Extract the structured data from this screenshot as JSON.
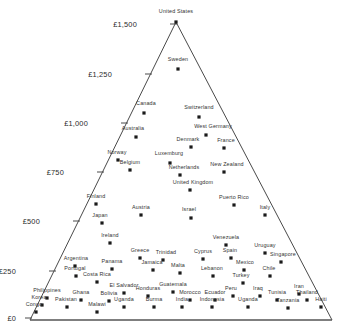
{
  "chart_data": {
    "type": "scatter",
    "title": "",
    "subtitle": "",
    "xlabel": "",
    "ylabel": "",
    "axis_tick_labels": [
      "£1,500",
      "£1,250",
      "£1,000",
      "£750",
      "£500",
      "£250",
      "£0"
    ],
    "axis_tick_values": [
      1500,
      1250,
      1000,
      750,
      500,
      250,
      0
    ],
    "ylim": [
      0,
      1500
    ],
    "grid": false,
    "legend": "none",
    "shape": "triangle",
    "currency_symbol": "£",
    "points": [
      {
        "label": "United States",
        "value": 1500,
        "x": 176,
        "y": 22,
        "lx": 176,
        "ly": 11
      },
      {
        "label": "Sweden",
        "value": 1190,
        "x": 178,
        "y": 69,
        "lx": 178,
        "ly": 59
      },
      {
        "label": "Canada",
        "value": 990,
        "x": 144,
        "y": 113,
        "lx": 146,
        "ly": 103
      },
      {
        "label": "Switzerland",
        "value": 980,
        "x": 199,
        "y": 117,
        "lx": 199,
        "ly": 107
      },
      {
        "label": "Australia",
        "value": 930,
        "x": 136,
        "y": 137,
        "lx": 133,
        "ly": 128
      },
      {
        "label": "West Germany",
        "value": 910,
        "x": 206,
        "y": 135,
        "lx": 213,
        "ly": 126
      },
      {
        "label": "Denmark",
        "value": 880,
        "x": 191,
        "y": 147,
        "lx": 188,
        "ly": 139
      },
      {
        "label": "France",
        "value": 860,
        "x": 224,
        "y": 148,
        "lx": 226,
        "ly": 140
      },
      {
        "label": "Norway",
        "value": 800,
        "x": 118,
        "y": 160,
        "lx": 117,
        "ly": 152
      },
      {
        "label": "Luxemburg",
        "value": 800,
        "x": 170,
        "y": 163,
        "lx": 169,
        "ly": 153
      },
      {
        "label": "Belgium",
        "value": 775,
        "x": 130,
        "y": 170,
        "lx": 130,
        "ly": 162
      },
      {
        "label": "Netherlands",
        "value": 760,
        "x": 180,
        "y": 175,
        "lx": 184,
        "ly": 167
      },
      {
        "label": "New Zealand",
        "value": 755,
        "x": 224,
        "y": 172,
        "lx": 227,
        "ly": 164
      },
      {
        "label": "United Kingdom",
        "value": 720,
        "x": 190,
        "y": 190,
        "lx": 193,
        "ly": 182
      },
      {
        "label": "Finland",
        "value": 620,
        "x": 96,
        "y": 204,
        "lx": 96,
        "ly": 196
      },
      {
        "label": "Puerto Rico",
        "value": 600,
        "x": 234,
        "y": 205,
        "lx": 234,
        "ly": 197
      },
      {
        "label": "Austria",
        "value": 580,
        "x": 141,
        "y": 215,
        "lx": 141,
        "ly": 207
      },
      {
        "label": "Israel",
        "value": 570,
        "x": 191,
        "y": 218,
        "lx": 189,
        "ly": 209
      },
      {
        "label": "Italy",
        "value": 560,
        "x": 265,
        "y": 215,
        "lx": 265,
        "ly": 207
      },
      {
        "label": "Japan",
        "value": 530,
        "x": 102,
        "y": 223,
        "lx": 100,
        "ly": 215
      },
      {
        "label": "Ireland",
        "value": 470,
        "x": 110,
        "y": 243,
        "lx": 110,
        "ly": 235
      },
      {
        "label": "Venezuela",
        "value": 450,
        "x": 226,
        "y": 245,
        "lx": 226,
        "ly": 237
      },
      {
        "label": "Uruguay",
        "value": 430,
        "x": 265,
        "y": 253,
        "lx": 265,
        "ly": 245
      },
      {
        "label": "Greece",
        "value": 400,
        "x": 140,
        "y": 258,
        "lx": 140,
        "ly": 250
      },
      {
        "label": "Spain",
        "value": 395,
        "x": 231,
        "y": 258,
        "lx": 230,
        "ly": 250
      },
      {
        "label": "Singapore",
        "value": 385,
        "x": 281,
        "y": 262,
        "lx": 283,
        "ly": 254
      },
      {
        "label": "Trinidad",
        "value": 390,
        "x": 163,
        "y": 260,
        "lx": 166,
        "ly": 252
      },
      {
        "label": "Cyprus",
        "value": 385,
        "x": 203,
        "y": 259,
        "lx": 203,
        "ly": 251
      },
      {
        "label": "Argentina",
        "value": 345,
        "x": 75,
        "y": 266,
        "lx": 76,
        "ly": 258
      },
      {
        "label": "Panama",
        "value": 330,
        "x": 112,
        "y": 269,
        "lx": 112,
        "ly": 261
      },
      {
        "label": "Mexico",
        "value": 325,
        "x": 244,
        "y": 270,
        "lx": 245,
        "ly": 262
      },
      {
        "label": "Jamaica",
        "value": 320,
        "x": 153,
        "y": 270,
        "lx": 152,
        "ly": 262
      },
      {
        "label": "Malta",
        "value": 310,
        "x": 180,
        "y": 273,
        "lx": 178,
        "ly": 265
      },
      {
        "label": "Portugal",
        "value": 300,
        "x": 76,
        "y": 276,
        "lx": 75,
        "ly": 268
      },
      {
        "label": "Lebanon",
        "value": 300,
        "x": 213,
        "y": 276,
        "lx": 212,
        "ly": 268
      },
      {
        "label": "Chile",
        "value": 300,
        "x": 270,
        "y": 276,
        "lx": 269,
        "ly": 268
      },
      {
        "label": "Costa Rica",
        "value": 285,
        "x": 97,
        "y": 282,
        "lx": 97,
        "ly": 274
      },
      {
        "label": "Turkey",
        "value": 280,
        "x": 243,
        "y": 283,
        "lx": 241,
        "ly": 275
      },
      {
        "label": "Guatemala",
        "value": 250,
        "x": 173,
        "y": 292,
        "lx": 173,
        "ly": 284
      },
      {
        "label": "El Salvador",
        "value": 245,
        "x": 124,
        "y": 293,
        "lx": 124,
        "ly": 285
      },
      {
        "label": "Honduras",
        "value": 240,
        "x": 148,
        "y": 296,
        "lx": 148,
        "ly": 288
      },
      {
        "label": "Peru",
        "value": 240,
        "x": 233,
        "y": 296,
        "lx": 231,
        "ly": 288
      },
      {
        "label": "Iraq",
        "value": 235,
        "x": 260,
        "y": 296,
        "lx": 258,
        "ly": 288
      },
      {
        "label": "Iran",
        "value": 235,
        "x": 299,
        "y": 294,
        "lx": 299,
        "ly": 286
      },
      {
        "label": "Philippines",
        "value": 225,
        "x": 47,
        "y": 298,
        "lx": 47,
        "ly": 290
      },
      {
        "label": "Ghana",
        "value": 220,
        "x": 81,
        "y": 300,
        "lx": 81,
        "ly": 292
      },
      {
        "label": "Bolivia",
        "value": 215,
        "x": 109,
        "y": 301,
        "lx": 109,
        "ly": 293
      },
      {
        "label": "Morocco",
        "value": 215,
        "x": 190,
        "y": 300,
        "lx": 190,
        "ly": 292
      },
      {
        "label": "Ecuador",
        "value": 215,
        "x": 215,
        "y": 300,
        "lx": 215,
        "ly": 292
      },
      {
        "label": "Tunisia",
        "value": 215,
        "x": 277,
        "y": 300,
        "lx": 277,
        "ly": 292
      },
      {
        "label": "Thailand",
        "value": 210,
        "x": 307,
        "y": 300,
        "lx": 307,
        "ly": 292
      },
      {
        "label": "Korea",
        "value": 200,
        "x": 42,
        "y": 305,
        "lx": 39,
        "ly": 297
      },
      {
        "label": "Pakistan",
        "value": 195,
        "x": 67,
        "y": 307,
        "lx": 66,
        "ly": 299
      },
      {
        "label": "Uganda",
        "value": 190,
        "x": 124,
        "y": 307,
        "lx": 124,
        "ly": 299
      },
      {
        "label": "Burma",
        "value": 190,
        "x": 154,
        "y": 307,
        "lx": 154,
        "ly": 299
      },
      {
        "label": "India",
        "value": 190,
        "x": 182,
        "y": 307,
        "lx": 182,
        "ly": 299
      },
      {
        "label": "Indonesia",
        "value": 188,
        "x": 212,
        "y": 307,
        "lx": 212,
        "ly": 299
      },
      {
        "label": "Uganda",
        "value": 188,
        "x": 248,
        "y": 307,
        "lx": 248,
        "ly": 299
      },
      {
        "label": "Tanzania",
        "value": 185,
        "x": 288,
        "y": 308,
        "lx": 288,
        "ly": 300
      },
      {
        "label": "Haiti",
        "value": 185,
        "x": 321,
        "y": 307,
        "lx": 321,
        "ly": 299
      },
      {
        "label": "Congo",
        "value": 170,
        "x": 36,
        "y": 312,
        "lx": 34,
        "ly": 304
      },
      {
        "label": "Malawi",
        "value": 170,
        "x": 97,
        "y": 312,
        "lx": 97,
        "ly": 304
      }
    ],
    "triangle": {
      "apex": {
        "x": 176,
        "y": 22
      },
      "bottom_left": {
        "x": 30,
        "y": 320
      },
      "bottom_right": {
        "x": 332,
        "y": 320
      }
    },
    "ticks": [
      {
        "label": "£1,500",
        "tx": 176,
        "ty": 24,
        "lx": 137,
        "ly": 24
      },
      {
        "label": "£1,250",
        "tx": 151,
        "ty": 74,
        "lx": 112,
        "ly": 74
      },
      {
        "label": "£1,000",
        "tx": 127,
        "ty": 123,
        "lx": 88,
        "ly": 123
      },
      {
        "label": "£750",
        "tx": 103,
        "ty": 172,
        "lx": 64,
        "ly": 172
      },
      {
        "label": "£500",
        "tx": 79,
        "ty": 221,
        "lx": 40,
        "ly": 221
      },
      {
        "label": "£250",
        "tx": 55,
        "ty": 271,
        "lx": 16,
        "ly": 271
      },
      {
        "label": "£0",
        "tx": 31,
        "ty": 318,
        "lx": 16,
        "ly": 318
      }
    ]
  }
}
